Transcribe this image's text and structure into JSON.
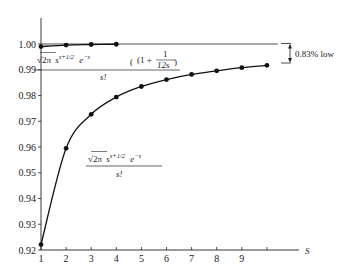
{
  "chart_data": {
    "type": "line",
    "title": "",
    "xlabel": "S",
    "ylabel": "",
    "xlim": [
      1,
      10.3
    ],
    "ylim": [
      0.92,
      1.02
    ],
    "grid": false,
    "x_ticks": [
      1,
      2,
      3,
      4,
      5,
      6,
      7,
      8,
      9,
      10
    ],
    "x_tick_labels": [
      "1",
      "2",
      "3",
      "4",
      "5",
      "6",
      "7",
      "8",
      "9",
      ""
    ],
    "y_ticks": [
      0.92,
      0.93,
      0.94,
      0.95,
      0.96,
      0.97,
      0.98,
      0.99,
      1.0,
      1.02
    ],
    "y_tick_labels": [
      "0.92",
      "0.93",
      "0.94",
      "0.95",
      "0.96",
      "0.97",
      "0.98",
      "0.99",
      "1.00",
      "1.02"
    ],
    "reference_line": {
      "y": 1.0
    },
    "series": [
      {
        "name": "Stirling with correction: sqrt(2π) s^(s+1/2) e^(-s) (1 + 1/(12s)) / s!",
        "x": [
          1,
          2,
          3,
          4
        ],
        "values": [
          0.999,
          0.9996,
          0.9998,
          0.9999
        ]
      },
      {
        "name": "Stirling: sqrt(2π) s^(s+1/2) e^(-s) / s!",
        "x": [
          1,
          2,
          3,
          4,
          5,
          6,
          7,
          8,
          9,
          10
        ],
        "values": [
          0.9221,
          0.9595,
          0.9727,
          0.9794,
          0.9835,
          0.9862,
          0.9882,
          0.9896,
          0.9908,
          0.9917
        ]
      }
    ],
    "annotations": [
      {
        "text": "0.83% low",
        "type": "bracket",
        "from_y": 1.0,
        "to_y": 0.9917,
        "at_x": 10
      },
      {
        "text": "√2π s^(s+1/2) e^(−s) (1 + 1/12s) / s!",
        "target_series": 0
      },
      {
        "text": "√2π s^(s+1/2) e^(−s) / s!",
        "target_series": 1
      }
    ]
  },
  "labels": {
    "axis_var": "S",
    "bracket": "0.83% low",
    "upper_formula": {
      "sqrt": "√2π",
      "base": "s",
      "exp1": "s+1/2",
      "e": "e",
      "exp2": "−s",
      "factor_open": "(1 +",
      "frac_num": "1",
      "frac_den": "12s",
      "factor_close": ")",
      "denominator": "s!"
    },
    "lower_formula": {
      "sqrt": "√2π",
      "base": "s",
      "exp1": "s+1/2",
      "e": "e",
      "exp2": "−s",
      "denominator": "s!"
    }
  }
}
